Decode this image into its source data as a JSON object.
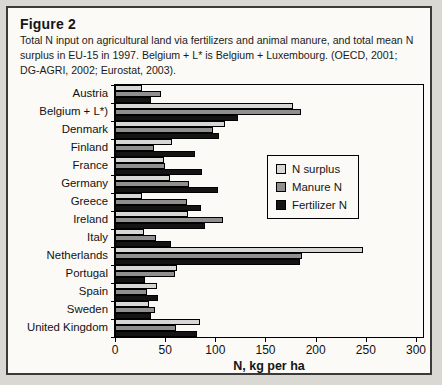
{
  "figure": {
    "title": "Figure 2",
    "caption": "Total N input on agricultural land via fertilizers and animal manure, and total mean N surplus in EU-15 in 1997. Belgium + L* is Belgium + Luxembourg.  (OECD, 2001; DG-AGRI, 2002; Eurostat, 2003)."
  },
  "colors": {
    "surplus": "#d6d6d4",
    "manure": "#8f8f8f",
    "fertilizer": "#141414",
    "panel_bg": "#fbfaf6",
    "border": "#000000"
  },
  "chart_data": {
    "type": "bar",
    "orientation": "horizontal",
    "title": "",
    "xlabel": "N, kg per ha",
    "ylabel": "",
    "xlim": [
      0,
      307
    ],
    "xticks": [
      0,
      50,
      100,
      150,
      200,
      250,
      300
    ],
    "grid": false,
    "legend_position": "inside-right",
    "categories": [
      "Austria",
      "Belgium + L*)",
      "Denmark",
      "Finland",
      "France",
      "Germany",
      "Greece",
      "Ireland",
      "Italy",
      "Netherlands",
      "Portugal",
      "Spain",
      "Sweden",
      "United Kingdom"
    ],
    "series": [
      {
        "name": "N surplus",
        "color": "#d6d6d4",
        "values": [
          27,
          177,
          110,
          57,
          49,
          55,
          27,
          73,
          29,
          247,
          62,
          42,
          34,
          85
        ]
      },
      {
        "name": "Manure N",
        "color": "#8f8f8f",
        "values": [
          46,
          185,
          98,
          39,
          50,
          74,
          72,
          108,
          41,
          186,
          60,
          32,
          40,
          61
        ]
      },
      {
        "name": "Fertilizer N",
        "color": "#141414",
        "values": [
          36,
          123,
          104,
          80,
          87,
          103,
          86,
          90,
          56,
          184,
          30,
          43,
          36,
          82
        ]
      }
    ]
  }
}
